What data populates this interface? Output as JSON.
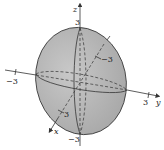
{
  "figure": {
    "axes": {
      "z": {
        "name": "z",
        "pos_tick": "3",
        "neg_tick": "−3"
      },
      "y": {
        "name": "y",
        "pos_tick": "3",
        "neg_tick": "−3"
      },
      "x": {
        "name": "x",
        "pos_tick": "3",
        "neg_tick": "−3"
      }
    },
    "colors": {
      "fill": "#b9b9b9",
      "stroke": "#333333",
      "axis": "#333333"
    }
  }
}
